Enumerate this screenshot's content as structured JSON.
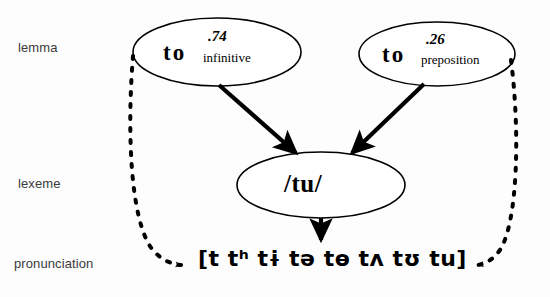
{
  "diagram": {
    "tiers": [
      {
        "id": "lemma",
        "label": "lemma"
      },
      {
        "id": "lexeme",
        "label": "lexeme"
      },
      {
        "id": "pronunciation",
        "label": "pronunciation"
      }
    ],
    "lemma_nodes": [
      {
        "id": "infinitive",
        "word": "to",
        "probability": ".74",
        "sense": "infinitive"
      },
      {
        "id": "preposition",
        "word": "to",
        "probability": ".26",
        "sense": "preposition"
      }
    ],
    "lexeme_node": {
      "id": "tu",
      "text": "/tu/"
    },
    "pronunciation_node": {
      "id": "variants",
      "text": "[t tʰ tɨ tə tɵ tʌ tʊ tu]",
      "variants": [
        "t",
        "tʰ",
        "tɨ",
        "tə",
        "tɵ",
        "tʌ",
        "tʊ",
        "tu"
      ],
      "open_bracket": "[",
      "close_bracket": "]"
    },
    "edges": [
      {
        "id": "inf-to-lexeme",
        "from": "infinitive",
        "to": "tu",
        "style": "solid",
        "arrow": "down-right"
      },
      {
        "id": "prep-to-lexeme",
        "from": "preposition",
        "to": "tu",
        "style": "solid",
        "arrow": "down-left"
      },
      {
        "id": "lexeme-to-pron",
        "from": "tu",
        "to": "variants",
        "style": "solid",
        "arrow": "down"
      },
      {
        "id": "inf-to-pron",
        "from": "infinitive",
        "to": "variants",
        "style": "dashed",
        "arrow": "right"
      },
      {
        "id": "prep-to-pron",
        "from": "preposition",
        "to": "variants",
        "style": "dashed",
        "arrow": "left"
      }
    ],
    "colors": {
      "stroke": "#000000",
      "label_text": "#3a3a3a",
      "node_text": "#000000",
      "background": "#fdfdfd"
    }
  }
}
